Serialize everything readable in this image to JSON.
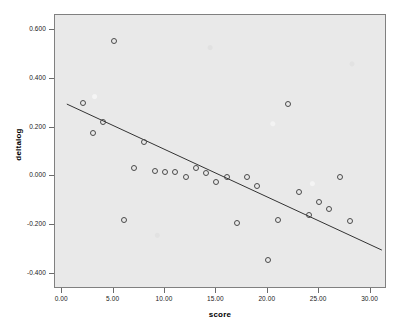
{
  "chart_data": {
    "type": "scatter",
    "title": "",
    "xlabel": "score",
    "ylabel": "deltalog",
    "xlim": [
      -0.7,
      31.6
    ],
    "ylim": [
      -0.46,
      0.66
    ],
    "grid": false,
    "legend": null,
    "xticks": [
      "0.00",
      "5.00",
      "10.00",
      "15.00",
      "20.00",
      "25.00",
      "30.00"
    ],
    "xtick_values": [
      0,
      5,
      10,
      15,
      20,
      25,
      30
    ],
    "yticks": [
      "0.600",
      "0.400",
      "0.200",
      "0.000",
      "-0.200",
      "-0.400"
    ],
    "ytick_values": [
      0.6,
      0.4,
      0.2,
      0.0,
      -0.2,
      -0.4
    ],
    "marker": "open-circle",
    "marker_color": "#4a4a4a",
    "plot_background": "#e9e9e9",
    "points": [
      {
        "x": 2,
        "y": 0.302
      },
      {
        "x": 3,
        "y": 0.176
      },
      {
        "x": 4,
        "y": 0.221
      },
      {
        "x": 5,
        "y": 0.554
      },
      {
        "x": 6,
        "y": -0.178
      },
      {
        "x": 7,
        "y": 0.034
      },
      {
        "x": 8,
        "y": 0.139
      },
      {
        "x": 9,
        "y": 0.021
      },
      {
        "x": 10,
        "y": 0.019
      },
      {
        "x": 11,
        "y": 0.017
      },
      {
        "x": 12,
        "y": -0.002
      },
      {
        "x": 13,
        "y": 0.035
      },
      {
        "x": 14,
        "y": 0.014
      },
      {
        "x": 15,
        "y": -0.021
      },
      {
        "x": 16,
        "y": -0.001
      },
      {
        "x": 17,
        "y": -0.192
      },
      {
        "x": 18,
        "y": -0.002
      },
      {
        "x": 19,
        "y": -0.041
      },
      {
        "x": 20,
        "y": -0.341
      },
      {
        "x": 21,
        "y": -0.178
      },
      {
        "x": 22,
        "y": 0.298
      },
      {
        "x": 23,
        "y": -0.062
      },
      {
        "x": 24,
        "y": -0.156
      },
      {
        "x": 25,
        "y": -0.104
      },
      {
        "x": 26,
        "y": -0.131
      },
      {
        "x": 27,
        "y": -0.004
      },
      {
        "x": 28,
        "y": -0.183
      }
    ],
    "fit_line": {
      "name": "linear-regression-line",
      "color": "#333333",
      "x0": 0.45,
      "y0": 0.296,
      "x1": 31.1,
      "y1": -0.301
    }
  }
}
